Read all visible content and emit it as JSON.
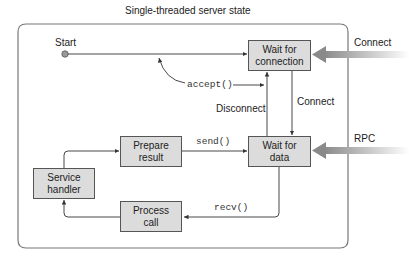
{
  "title": "Single-threaded server state",
  "start": {
    "label": "Start"
  },
  "states": [
    {
      "id": "wait_connection",
      "line1": "Wait for",
      "line2": "connection"
    },
    {
      "id": "wait_data",
      "line1": "Wait for",
      "line2": "data"
    },
    {
      "id": "prepare_result",
      "line1": "Prepare",
      "line2": "result"
    },
    {
      "id": "service_handler",
      "line1": "Service",
      "line2": "handler"
    },
    {
      "id": "process_call",
      "line1": "Process",
      "line2": "call"
    }
  ],
  "transitions": {
    "accept": "accept()",
    "disconnect": "Disconnect",
    "connect_internal": "Connect",
    "send": "send()",
    "recv": "recv()"
  },
  "external_events": {
    "connect": "Connect",
    "rpc": "RPC"
  },
  "colors": {
    "box_fill": "#dcdcdc",
    "box_border": "#555555",
    "line": "#333333",
    "frame": "#777777",
    "external_arrow": "#999999"
  }
}
